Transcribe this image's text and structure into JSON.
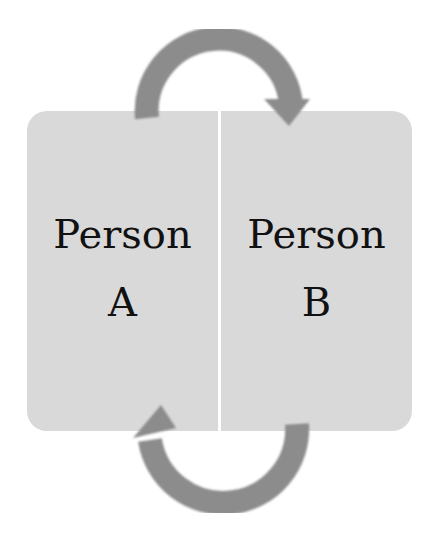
{
  "diagram": {
    "type": "cyclic-exchange",
    "nodes": [
      {
        "id": "A",
        "label_line1": "Person",
        "label_line2": "A"
      },
      {
        "id": "B",
        "label_line1": "Person",
        "label_line2": "B"
      }
    ],
    "edges": [
      {
        "from": "A",
        "to": "B",
        "path": "arc-over-top"
      },
      {
        "from": "B",
        "to": "A",
        "path": "arc-under-bottom"
      }
    ],
    "colors": {
      "box_fill": "#d9d9d9",
      "arrow_fill": "#8c8c8c",
      "text": "#111111",
      "background": "#ffffff"
    }
  }
}
